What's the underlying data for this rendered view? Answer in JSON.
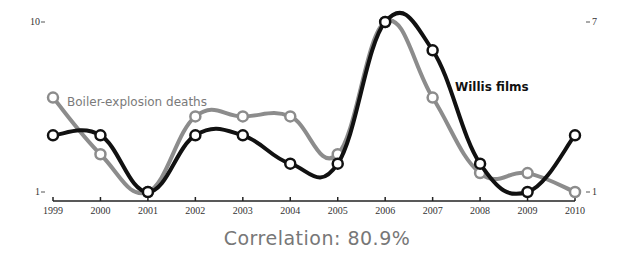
{
  "chart_data": {
    "type": "line",
    "title": "",
    "caption": "Correlation: 80.9%",
    "x": [
      "1999",
      "2000",
      "2001",
      "2002",
      "2003",
      "2004",
      "2005",
      "2006",
      "2007",
      "2008",
      "2009",
      "2010"
    ],
    "series": [
      {
        "name": "Boiler-explosion deaths",
        "axis": "left",
        "color": "#8c8c8c",
        "values": [
          6,
          3,
          1,
          5,
          5,
          5,
          3,
          10,
          6,
          2,
          2,
          1
        ]
      },
      {
        "name": "Willis films",
        "axis": "right",
        "color": "#111111",
        "values": [
          3,
          3,
          1,
          3,
          3,
          2,
          2,
          7,
          6,
          2,
          1,
          3
        ]
      }
    ],
    "left_axis": {
      "ticks": [
        "1",
        "10"
      ],
      "range": [
        1,
        10
      ]
    },
    "right_axis": {
      "ticks": [
        "1",
        "7"
      ],
      "range": [
        1,
        7
      ]
    },
    "xlabel": "",
    "ylabel": "",
    "grid": false,
    "legend": "inline labels"
  },
  "labels": {
    "left_top": "10",
    "left_bottom": "1",
    "right_top": "7",
    "right_bottom": "1",
    "gray_series": "Boiler-explosion deaths",
    "black_series": "Willis films",
    "correlation": "Correlation: 80.9%"
  }
}
